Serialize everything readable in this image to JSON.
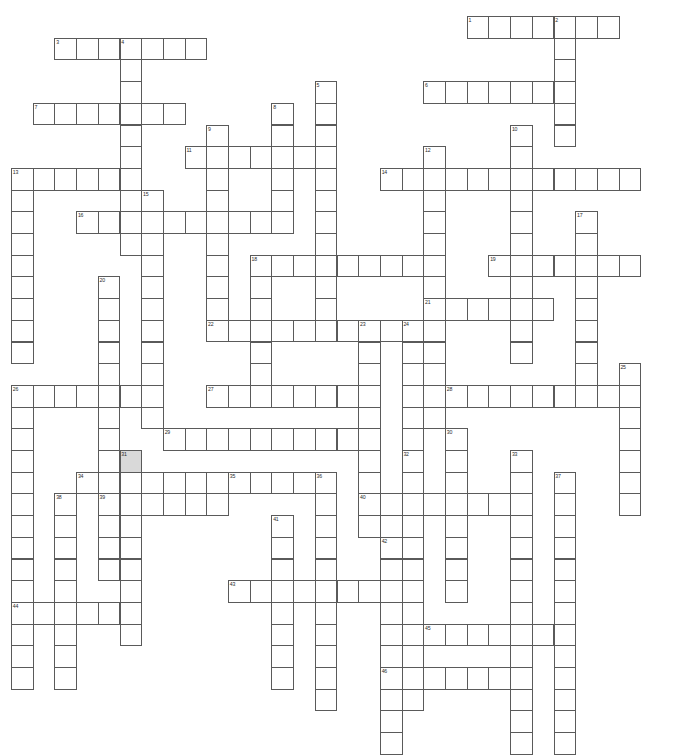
{
  "puzzle": {
    "kind": "crossword-grid",
    "title": "Crossword Puzzle Grid",
    "cell_size": 21.7,
    "origin_x": 11,
    "origin_y": 16,
    "cols": 31,
    "rows": 33,
    "cell_color": "#ffffff",
    "shaded_color": "#d9d9d9",
    "border_color": "#5a5a5a",
    "number_color": "#2b2b2b",
    "background": "#ffffff",
    "shaded_cells": [
      [
        6,
        21
      ]
    ],
    "entries": [
      {
        "number": "1",
        "direction": "across",
        "col": 22,
        "row": 1,
        "length": 7
      },
      {
        "number": "2",
        "direction": "down",
        "col": 26,
        "row": 1,
        "length": 6
      },
      {
        "number": "3",
        "direction": "across",
        "col": 3,
        "row": 2,
        "length": 7
      },
      {
        "number": "4",
        "direction": "down",
        "col": 6,
        "row": 2,
        "length": 10
      },
      {
        "number": "5",
        "direction": "down",
        "col": 15,
        "row": 4,
        "length": 12
      },
      {
        "number": "6",
        "direction": "across",
        "col": 20,
        "row": 4,
        "length": 7
      },
      {
        "number": "7",
        "direction": "across",
        "col": 2,
        "row": 5,
        "length": 7
      },
      {
        "number": "8",
        "direction": "down",
        "col": 13,
        "row": 5,
        "length": 6
      },
      {
        "number": "9",
        "direction": "down",
        "col": 10,
        "row": 6,
        "length": 9
      },
      {
        "number": "10",
        "direction": "down",
        "col": 24,
        "row": 6,
        "length": 11
      },
      {
        "number": "11",
        "direction": "across",
        "col": 9,
        "row": 7,
        "length": 6
      },
      {
        "number": "12",
        "direction": "down",
        "col": 20,
        "row": 7,
        "length": 13
      },
      {
        "number": "13",
        "direction": "across",
        "col": 1,
        "row": 8,
        "length": 6
      },
      {
        "number": "13",
        "direction": "down",
        "col": 1,
        "row": 8,
        "length": 9
      },
      {
        "number": "14",
        "direction": "across",
        "col": 18,
        "row": 8,
        "length": 12
      },
      {
        "number": "15",
        "direction": "down",
        "col": 7,
        "row": 9,
        "length": 11
      },
      {
        "number": "16",
        "direction": "across",
        "col": 4,
        "row": 10,
        "length": 9
      },
      {
        "number": "17",
        "direction": "down",
        "col": 27,
        "row": 10,
        "length": 9
      },
      {
        "number": "18",
        "direction": "across",
        "col": 12,
        "row": 12,
        "length": 8
      },
      {
        "number": "18",
        "direction": "down",
        "col": 12,
        "row": 12,
        "length": 7
      },
      {
        "number": "19",
        "direction": "across",
        "col": 23,
        "row": 12,
        "length": 7
      },
      {
        "number": "20",
        "direction": "down",
        "col": 5,
        "row": 13,
        "length": 14
      },
      {
        "number": "21",
        "direction": "across",
        "col": 20,
        "row": 14,
        "length": 6
      },
      {
        "number": "22",
        "direction": "across",
        "col": 10,
        "row": 15,
        "length": 11
      },
      {
        "number": "23",
        "direction": "down",
        "col": 17,
        "row": 15,
        "length": 10
      },
      {
        "number": "24",
        "direction": "down",
        "col": 19,
        "row": 15,
        "length": 10
      },
      {
        "number": "25",
        "direction": "down",
        "col": 29,
        "row": 17,
        "length": 7
      },
      {
        "number": "26",
        "direction": "across",
        "col": 1,
        "row": 18,
        "length": 7
      },
      {
        "number": "26",
        "direction": "down",
        "col": 1,
        "row": 18,
        "length": 14
      },
      {
        "number": "27",
        "direction": "across",
        "col": 10,
        "row": 18,
        "length": 7
      },
      {
        "number": "28",
        "direction": "across",
        "col": 21,
        "row": 18,
        "length": 8
      },
      {
        "number": "29",
        "direction": "across",
        "col": 8,
        "row": 20,
        "length": 9
      },
      {
        "number": "30",
        "direction": "down",
        "col": 21,
        "row": 20,
        "length": 8
      },
      {
        "number": "31",
        "direction": "down",
        "col": 6,
        "row": 21,
        "length": 9
      },
      {
        "number": "32",
        "direction": "down",
        "col": 19,
        "row": 21,
        "length": 12
      },
      {
        "number": "33",
        "direction": "down",
        "col": 24,
        "row": 21,
        "length": 14
      },
      {
        "number": "34",
        "direction": "across",
        "col": 4,
        "row": 22,
        "length": 12
      },
      {
        "number": "35",
        "direction": "across",
        "col": 11,
        "row": 22,
        "length": 3
      },
      {
        "number": "36",
        "direction": "down",
        "col": 15,
        "row": 22,
        "length": 11
      },
      {
        "number": "37",
        "direction": "down",
        "col": 26,
        "row": 22,
        "length": 13
      },
      {
        "number": "38",
        "direction": "down",
        "col": 3,
        "row": 23,
        "length": 9
      },
      {
        "number": "39",
        "direction": "across",
        "col": 5,
        "row": 23,
        "length": 6
      },
      {
        "number": "40",
        "direction": "across",
        "col": 17,
        "row": 23,
        "length": 8
      },
      {
        "number": "41",
        "direction": "down",
        "col": 13,
        "row": 24,
        "length": 8
      },
      {
        "number": "42",
        "direction": "down",
        "col": 18,
        "row": 25,
        "length": 10
      },
      {
        "number": "43",
        "direction": "across",
        "col": 11,
        "row": 27,
        "length": 8
      },
      {
        "number": "44",
        "direction": "across",
        "col": 1,
        "row": 28,
        "length": 5
      },
      {
        "number": "45",
        "direction": "across",
        "col": 20,
        "row": 29,
        "length": 6
      },
      {
        "number": "46",
        "direction": "across",
        "col": 18,
        "row": 31,
        "length": 7
      }
    ]
  }
}
